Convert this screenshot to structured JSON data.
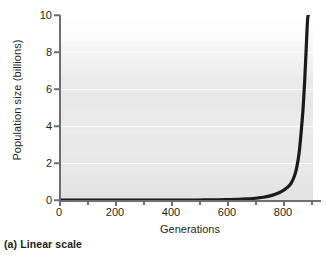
{
  "caption": "(a) Linear scale",
  "axes": {
    "ylabel": "Population size (billions)",
    "xlabel": "Generations",
    "yticks": [
      "0",
      "2",
      "4",
      "6",
      "8",
      "10"
    ],
    "xticks": [
      "0",
      "200",
      "400",
      "600",
      "800"
    ]
  },
  "colors": {
    "curve": "#1a1a1a",
    "axis": "#6d6e71",
    "text": "#231f20",
    "plot_bg_top": "#fdfdfd",
    "plot_bg_bottom": "#e2e2e2",
    "gridline": "#ffffff"
  },
  "chart_data": {
    "type": "line",
    "title": "(a) Linear scale",
    "xlabel": "Generations",
    "ylabel": "Population size (billions)",
    "xlim": [
      0,
      920
    ],
    "ylim": [
      0,
      10
    ],
    "xticks": [
      0,
      200,
      400,
      600,
      800
    ],
    "xminorticks": [
      100,
      300,
      500,
      700,
      900
    ],
    "yticks": [
      0,
      2,
      4,
      6,
      8,
      10
    ],
    "grid": "horizontal-only",
    "legend": null,
    "series": [
      {
        "name": "Exponential population growth",
        "x": [
          0,
          50,
          100,
          150,
          200,
          250,
          300,
          350,
          400,
          450,
          500,
          550,
          600,
          650,
          680,
          700,
          720,
          740,
          760,
          780,
          800,
          810,
          820,
          830,
          840,
          850,
          860,
          870,
          880,
          885,
          890,
          895,
          900,
          903
        ],
        "y": [
          0.0,
          0.0,
          0.0,
          0.0,
          0.0,
          0.0,
          0.0,
          0.0,
          0.0,
          0.0,
          0.0,
          0.01,
          0.02,
          0.04,
          0.06,
          0.08,
          0.11,
          0.15,
          0.21,
          0.3,
          0.42,
          0.5,
          0.6,
          0.72,
          0.9,
          1.2,
          1.7,
          2.6,
          4.2,
          5.2,
          6.5,
          8.1,
          9.7,
          10.0
        ]
      }
    ]
  }
}
